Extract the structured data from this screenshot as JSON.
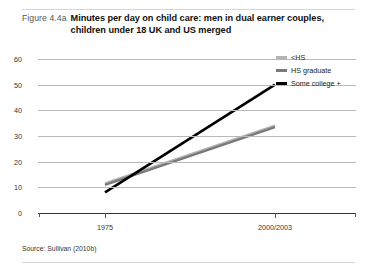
{
  "figure": {
    "label": "Figure 4.4a",
    "title": "Minutes per day on child care: men in dual earner couples, children under 18 UK and US merged",
    "source": "Source: Sullivan (2010b)"
  },
  "legend": {
    "position": "top-right",
    "items": [
      {
        "label": "<HS",
        "color": "#b3b3b3"
      },
      {
        "label": "HS graduate",
        "color": "#7a7a7a"
      },
      {
        "label": "Some college +",
        "color": "#000000"
      }
    ]
  },
  "axes": {
    "y_ticks": [
      "0",
      "10",
      "20",
      "30",
      "40",
      "50",
      "60"
    ],
    "x_ticks": [
      "1975",
      "2000/2003"
    ]
  },
  "chart_data": {
    "type": "line",
    "title": "Minutes per day on child care: men in dual earner couples, children under 18 UK and US merged",
    "xlabel": "",
    "ylabel": "",
    "categories": [
      "1975",
      "2000/2003"
    ],
    "x": [
      1975,
      2001.5
    ],
    "xlim": [
      1975,
      2001.5
    ],
    "ylim": [
      0,
      60
    ],
    "yticks": [
      0,
      10,
      20,
      30,
      40,
      50,
      60
    ],
    "grid": true,
    "legend_position": "top-right",
    "series": [
      {
        "name": "<HS",
        "values": [
          11.5,
          34
        ],
        "color": "#b3b3b3"
      },
      {
        "name": "HS graduate",
        "values": [
          11,
          33.5
        ],
        "color": "#7a7a7a"
      },
      {
        "name": "Some college +",
        "values": [
          8,
          50
        ],
        "color": "#000000"
      }
    ]
  }
}
